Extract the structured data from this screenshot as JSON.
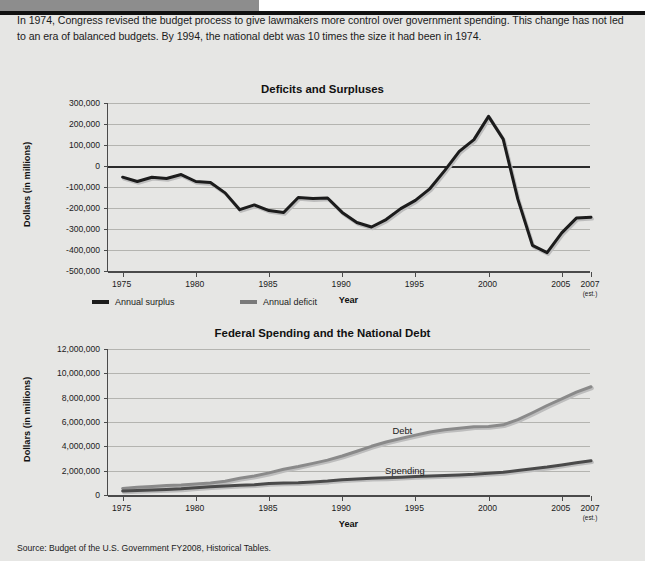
{
  "header": {
    "band_color": "#8d8d8d",
    "rule_color": "#111111"
  },
  "intro": {
    "text": "In 1974, Congress revised the budget process to give lawmakers more control over government spending. This change has not led to an era of balanced budgets. By 1994, the national debt was 10 times the size it had been in 1974."
  },
  "source": {
    "text": "Source: Budget of the U.S. Government FY2008, Historical Tables."
  },
  "colors": {
    "surplus": "#1c1c1c",
    "deficit": "#7a7a7a",
    "debt": "#8a8a8a",
    "spending": "#4a4a4a",
    "grid": "#b4b4b0",
    "axis": "#4a4a4a",
    "sheet": "#e6e6e4"
  },
  "chart_data": [
    {
      "type": "line",
      "title": "Deficits and Surpluses",
      "xlabel": "Year",
      "ylabel": "Dollars (in millions)",
      "xlim": [
        1974,
        2007
      ],
      "ylim": [
        -500000,
        300000
      ],
      "grid": true,
      "yticks": [
        300000,
        200000,
        100000,
        0,
        -100000,
        -200000,
        -300000,
        -400000,
        -500000
      ],
      "ytick_labels": [
        "300,000",
        "200,000",
        "100,000",
        "0",
        "-100,000",
        "-200,000",
        "-300,000",
        "-400,000",
        "-500,000"
      ],
      "xticks": [
        1975,
        1980,
        1985,
        1990,
        1995,
        2000,
        2005,
        2007
      ],
      "xtick_labels": [
        "1975",
        "1980",
        "1985",
        "1990",
        "1995",
        "2000",
        "2005",
        "2007"
      ],
      "xtick_sublabels": [
        "",
        "",
        "",
        "",
        "",
        "",
        "",
        "(est.)"
      ],
      "legend": {
        "position": "below-left",
        "entries": [
          {
            "label": "Annual surplus",
            "color": "#1c1c1c"
          },
          {
            "label": "Annual deficit",
            "color": "#7a7a7a"
          }
        ]
      },
      "x": [
        1975,
        1976,
        1977,
        1978,
        1979,
        1980,
        1981,
        1982,
        1983,
        1984,
        1985,
        1986,
        1987,
        1988,
        1989,
        1990,
        1991,
        1992,
        1993,
        1994,
        1995,
        1996,
        1997,
        1998,
        1999,
        2000,
        2001,
        2002,
        2003,
        2004,
        2005,
        2006,
        2007
      ],
      "values": [
        -53242,
        -73732,
        -53659,
        -59186,
        -40726,
        -73830,
        -78968,
        -127977,
        -207802,
        -185367,
        -212308,
        -221227,
        -149730,
        -155178,
        -152639,
        -221036,
        -269238,
        -290321,
        -255051,
        -203186,
        -163952,
        -107431,
        -21884,
        69270,
        125610,
        236241,
        128236,
        -157758,
        -377585,
        -412727,
        -318346,
        -248181,
        -244200
      ]
    },
    {
      "type": "line",
      "title": "Federal Spending and the National Debt",
      "xlabel": "Year",
      "ylabel": "Dollars (in millions)",
      "xlim": [
        1974,
        2007
      ],
      "ylim": [
        0,
        12000000
      ],
      "grid": true,
      "yticks": [
        12000000,
        10000000,
        8000000,
        6000000,
        4000000,
        2000000,
        0
      ],
      "ytick_labels": [
        "12,000,000",
        "10,000,000",
        "8,000,000",
        "6,000,000",
        "4,000,000",
        "2,000,000",
        "0"
      ],
      "xticks": [
        1975,
        1980,
        1985,
        1990,
        1995,
        2000,
        2005,
        2007
      ],
      "xtick_labels": [
        "1975",
        "1980",
        "1985",
        "1990",
        "1995",
        "2000",
        "2005",
        "2007"
      ],
      "xtick_sublabels": [
        "",
        "",
        "",
        "",
        "",
        "",
        "",
        "(est.)"
      ],
      "x": [
        1975,
        1976,
        1977,
        1978,
        1979,
        1980,
        1981,
        1982,
        1983,
        1984,
        1985,
        1986,
        1987,
        1988,
        1989,
        1990,
        1991,
        1992,
        1993,
        1994,
        1995,
        1996,
        1997,
        1998,
        1999,
        2000,
        2001,
        2002,
        2003,
        2004,
        2005,
        2006,
        2007
      ],
      "series": [
        {
          "name": "Debt",
          "color": "#8a8a8a",
          "inline_label": "Debt",
          "values": [
            541925,
            628970,
            706398,
            776602,
            829467,
            909050,
            994845,
            1137345,
            1371710,
            1564657,
            1817521,
            2120629,
            2346125,
            2601307,
            2868039,
            3206564,
            3598498,
            4002136,
            4351416,
            4643711,
            4921005,
            5181921,
            5369707,
            5478719,
            5606088,
            5629000,
            5770000,
            6198000,
            6760000,
            7355000,
            7905000,
            8451000,
            8900000
          ]
        },
        {
          "name": "Spending",
          "color": "#4a4a4a",
          "inline_label": "Spending",
          "values": [
            332332,
            371792,
            409218,
            458746,
            504028,
            590941,
            678241,
            745743,
            808364,
            851805,
            946344,
            990382,
            1004017,
            1064416,
            1143744,
            1252993,
            1324226,
            1381529,
            1409386,
            1461753,
            1515742,
            1560484,
            1601116,
            1652458,
            1701842,
            1788950,
            1862846,
            2010894,
            2159899,
            2292853,
            2472205,
            2654880,
            2814000
          ]
        }
      ]
    }
  ]
}
